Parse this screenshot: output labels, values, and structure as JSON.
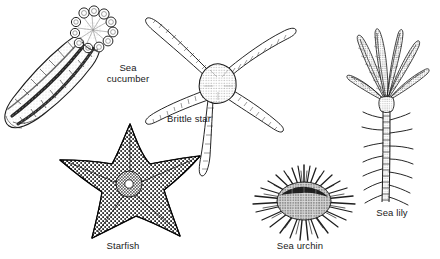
{
  "plate": {
    "title": "Echinoderm diversity illustration plate",
    "background_color": "#ffffff",
    "ink_color": "#1a1a1a",
    "style": "pen-and-ink scientific line drawing",
    "width": 440,
    "height": 259
  },
  "figures": [
    {
      "id": "sea-cucumber",
      "label": "Sea\ncucumber",
      "label_text": "Sea cucumber",
      "description": "Elongated sausage-shaped body oriented diagonally, with longitudinal rows of tube feet and a crown of branched feeding tentacles at the upper right end",
      "position": "top-left"
    },
    {
      "id": "brittle-star",
      "label": "Brittle star",
      "label_text": "Brittle star",
      "description": "Small stippled central disc with five long, slender, sinuous segmented arms",
      "position": "top-center"
    },
    {
      "id": "starfish",
      "label": "Starfish",
      "label_text": "Starfish",
      "description": "Thick five-rayed star with heavily granulated dark textured surface",
      "position": "bottom-left"
    },
    {
      "id": "sea-urchin",
      "label": "Sea urchin",
      "label_text": "Sea urchin",
      "description": "Globular test covered with a dense radiating halo of sharp spines",
      "position": "bottom-center"
    },
    {
      "id": "sea-lily",
      "label": "Sea lily",
      "label_text": "Sea lily",
      "description": "Feathery crown of pinnate arms atop a long segmented stalk bearing small side cirri",
      "position": "right"
    }
  ]
}
